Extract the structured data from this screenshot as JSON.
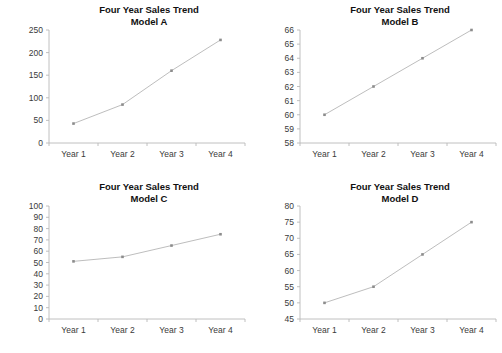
{
  "page": {
    "background_color": "#ffffff",
    "layout": "2x2-grid-of-line-charts"
  },
  "style": {
    "line_color": "#b6b6b6",
    "marker_color": "#8c8c8c",
    "axis_color": "#b9b9b9",
    "title_color": "#111111",
    "tick_label_color": "#3a3a3a"
  },
  "chart_data": [
    {
      "type": "line",
      "panel": "top-left",
      "title": "Four Year Sales Trend",
      "subtitle": "Model A",
      "xlabel": "",
      "ylabel": "",
      "categories": [
        "Year 1",
        "Year 2",
        "Year 3",
        "Year 4"
      ],
      "values": [
        43,
        85,
        160,
        228
      ],
      "ylim": [
        0,
        250
      ],
      "yticks": [
        0,
        50,
        100,
        150,
        200,
        250
      ],
      "grid": false,
      "legend": "none"
    },
    {
      "type": "line",
      "panel": "top-right",
      "title": "Four Year Sales Trend",
      "subtitle": "Model B",
      "xlabel": "",
      "ylabel": "",
      "categories": [
        "Year 1",
        "Year 2",
        "Year 3",
        "Year 4"
      ],
      "values": [
        60,
        62,
        64,
        66
      ],
      "ylim": [
        58,
        66
      ],
      "yticks": [
        58,
        59,
        60,
        61,
        62,
        63,
        64,
        65,
        66
      ],
      "grid": false,
      "legend": "none"
    },
    {
      "type": "line",
      "panel": "bottom-left",
      "title": "Four Year Sales Trend",
      "subtitle": "Model C",
      "xlabel": "",
      "ylabel": "",
      "categories": [
        "Year 1",
        "Year 2",
        "Year 3",
        "Year 4"
      ],
      "values": [
        51,
        55,
        65,
        75
      ],
      "ylim": [
        0,
        100
      ],
      "yticks": [
        0,
        10,
        20,
        30,
        40,
        50,
        60,
        70,
        80,
        90,
        100
      ],
      "grid": false,
      "legend": "none"
    },
    {
      "type": "line",
      "panel": "bottom-right",
      "title": "Four Year Sales Trend",
      "subtitle": "Model D",
      "xlabel": "",
      "ylabel": "",
      "categories": [
        "Year 1",
        "Year 2",
        "Year 3",
        "Year 4"
      ],
      "values": [
        50,
        55,
        65,
        75
      ],
      "ylim": [
        45,
        80
      ],
      "yticks": [
        45,
        50,
        55,
        60,
        65,
        70,
        75,
        80
      ],
      "grid": false,
      "legend": "none"
    }
  ]
}
